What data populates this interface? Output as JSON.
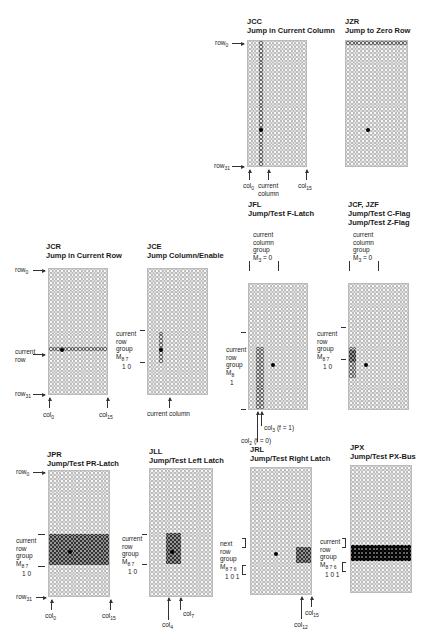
{
  "grid": {
    "rows": 32,
    "cols": 16
  },
  "panels": [
    {
      "id": "jcc",
      "code": "JCC",
      "title": "Jump in Current Column",
      "labels": {
        "row_top": "row",
        "row_top_sub": "0",
        "row_bottom": "row",
        "row_bottom_sub": "31",
        "col_left": "col",
        "col_left_sub": "0",
        "col_mid": "current column",
        "col_right": "col",
        "col_right_sub": "15"
      },
      "highlight": "column 3 (current column)",
      "dot": {
        "row": 22,
        "col": 3
      }
    },
    {
      "id": "jzr",
      "code": "JZR",
      "title": "Jump to Zero Row",
      "highlight": "row 0",
      "dot": {
        "row": 22,
        "col": 5
      }
    },
    {
      "id": "jcr",
      "code": "JCR",
      "title": "Jump in Current Row",
      "labels": {
        "row_top": "row",
        "row_top_sub": "0",
        "current_row": "current row",
        "row_bottom": "row",
        "row_bottom_sub": "31",
        "col_left": "col",
        "col_left_sub": "0",
        "col_right": "col",
        "col_right_sub": "15"
      },
      "highlight": "current row 20",
      "dot": {
        "row": 20,
        "col": 3
      }
    },
    {
      "id": "jce",
      "code": "JCE",
      "title": "Jump Column/Enable",
      "labels": {
        "group": [
          "current",
          "row",
          "group"
        ],
        "m": "M",
        "m_sub": "8 7",
        "m_vals": "1 0",
        "col_mid": "current column"
      },
      "highlight": "rows 16-23 in current column",
      "dot": {
        "row": 20,
        "col": 3
      }
    },
    {
      "id": "jfl",
      "code": "JFL",
      "title": "Jump/Test F-Latch",
      "labels": {
        "col_group": [
          "current",
          "column",
          "group"
        ],
        "m_top": "M",
        "m_top_sub": "3",
        "m_top_val": "= 0",
        "group": [
          "current",
          "row",
          "group"
        ],
        "m": "M",
        "m_sub": "8",
        "m_vals": "1",
        "col_a": "col",
        "col_a_sub": "3",
        "col_a_note": "(f = 1)",
        "col_b": "col",
        "col_b_sub": "2",
        "col_b_note": "(f = 0)"
      },
      "highlight": "rows 16-31, cols 2-3",
      "dot": {
        "row": 20,
        "col": 6
      }
    },
    {
      "id": "jcf",
      "code": "JCF, JZF",
      "title": "Jump/Test C-Flag",
      "title2": "Jump/Test Z-Flag",
      "labels": {
        "col_group": [
          "current",
          "column",
          "group"
        ],
        "m_top": "M",
        "m_top_sub": "3",
        "m_top_val": "= 0",
        "group": [
          "current",
          "row",
          "group"
        ],
        "m": "M",
        "m_sub": "8 7",
        "m_vals": "1 0"
      },
      "highlight": "rows 16-23, cols 0-1",
      "dot": {
        "row": 20,
        "col": 4
      }
    },
    {
      "id": "jpr",
      "code": "JPR",
      "title": "Jump/Test PR-Latch",
      "labels": {
        "row_top": "row",
        "row_top_sub": "0",
        "row_bottom": "row",
        "row_bottom_sub": "31",
        "group": [
          "current",
          "row",
          "group"
        ],
        "m": "M",
        "m_sub": "8 7",
        "m_vals": "1 0",
        "col_left": "col",
        "col_left_sub": "0",
        "col_right": "col",
        "col_right_sub": "15"
      },
      "highlight": "rows 16-23 all columns",
      "dot": {
        "row": 20,
        "col": 5
      }
    },
    {
      "id": "jll",
      "code": "JLL",
      "title": "Jump/Test Left Latch",
      "labels": {
        "group": [
          "current",
          "row",
          "group"
        ],
        "m": "M",
        "m_sub": "8 7",
        "m_vals": "1 0",
        "col_a": "col",
        "col_a_sub": "4",
        "col_b": "col",
        "col_b_sub": "7"
      },
      "highlight": "rows 16-23, cols 4-7",
      "dot": {
        "row": 20,
        "col": 5
      }
    },
    {
      "id": "jrl",
      "code": "JRL",
      "title": "Jump/Test Right Latch",
      "labels": {
        "group": [
          "next",
          "row",
          "group"
        ],
        "m": "M",
        "m_sub": "8 7 6",
        "m_vals": "1 0 1",
        "col_a": "col",
        "col_a_sub": "12",
        "col_b": "col",
        "col_b_sub": "15"
      },
      "highlight": "rows 20-23, cols 12-15",
      "dot": {
        "row": 21,
        "col": 6
      }
    },
    {
      "id": "jpx",
      "code": "JPX",
      "title": "Jump/Test PX-Bus",
      "labels": {
        "group": [
          "current",
          "row",
          "group"
        ],
        "m": "M",
        "m_sub": "8 7 6",
        "m_vals": "1 0 1"
      },
      "highlight": "rows 20-23 all columns"
    }
  ],
  "colors": {
    "cell_border": "#bdbdbd",
    "highlight_border": "#666666",
    "dark_fill": "#9a9a9a",
    "black_fill": "#111111"
  }
}
